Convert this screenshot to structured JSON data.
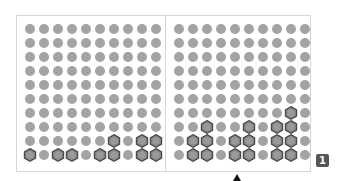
{
  "board": {
    "rows": 10,
    "cols": 10,
    "colors": {
      "dot": "#a3a3a3",
      "hex_fill": "#8c8c8c",
      "hex_stroke": "#4a4a4a"
    },
    "panels": [
      {
        "name": "left",
        "highlighted": [
          [
            9,
            7
          ],
          [
            9,
            9
          ],
          [
            9,
            10
          ],
          [
            10,
            1
          ],
          [
            10,
            3
          ],
          [
            10,
            4
          ],
          [
            10,
            6
          ],
          [
            10,
            7
          ],
          [
            10,
            9
          ],
          [
            10,
            10
          ]
        ]
      },
      {
        "name": "right",
        "highlighted": [
          [
            7,
            9
          ],
          [
            8,
            3
          ],
          [
            8,
            6
          ],
          [
            8,
            8
          ],
          [
            8,
            9
          ],
          [
            9,
            2
          ],
          [
            9,
            3
          ],
          [
            9,
            5
          ],
          [
            9,
            6
          ],
          [
            9,
            8
          ],
          [
            9,
            9
          ],
          [
            10,
            2
          ],
          [
            10,
            3
          ],
          [
            10,
            5
          ],
          [
            10,
            6
          ],
          [
            10,
            8
          ],
          [
            10,
            9
          ]
        ]
      }
    ]
  },
  "badge": {
    "label": "1"
  },
  "pointer": {
    "icon": "up-arrow-icon"
  }
}
